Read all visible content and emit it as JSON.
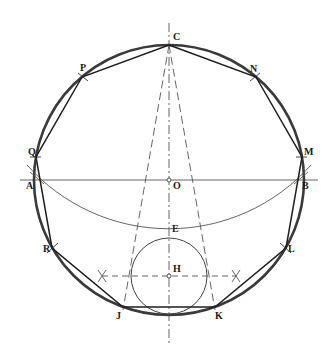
{
  "diagram": {
    "colors": {
      "circle": "#3a3a3a",
      "polygon": "#1e1e1e",
      "construction": "#555555",
      "background": "#ffffff"
    },
    "center": {
      "x": 169,
      "y": 180
    },
    "radius": 135,
    "labels": {
      "C": "C",
      "N": "N",
      "M": "M",
      "L": "L",
      "K": "K",
      "J": "J",
      "R": "R",
      "Q": "Q",
      "P": "P",
      "A": "A",
      "B": "B",
      "O": "O",
      "E": "E",
      "H": "H"
    },
    "points": {
      "C": {
        "x": 169,
        "y": 45
      },
      "N": {
        "x": 256,
        "y": 77
      },
      "M": {
        "x": 302,
        "y": 157
      },
      "L": {
        "x": 286,
        "y": 248
      },
      "K": {
        "x": 215,
        "y": 307
      },
      "J": {
        "x": 123,
        "y": 307
      },
      "R": {
        "x": 52,
        "y": 248
      },
      "Q": {
        "x": 36,
        "y": 157
      },
      "P": {
        "x": 82,
        "y": 77
      },
      "A": {
        "x": 34,
        "y": 180
      },
      "B": {
        "x": 304,
        "y": 180
      },
      "O": {
        "x": 169,
        "y": 180
      },
      "E": {
        "x": 169,
        "y": 235
      },
      "H": {
        "x": 169,
        "y": 276
      }
    },
    "inner_circle_radius": 38,
    "cross_marks": [
      {
        "x": 102,
        "y": 276
      },
      {
        "x": 236,
        "y": 276
      }
    ]
  }
}
